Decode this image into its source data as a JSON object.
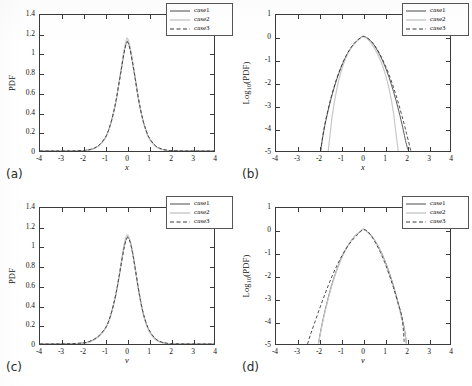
{
  "figure": {
    "panel_tags": [
      "(a)",
      "(b)",
      "(c)",
      "(d)"
    ],
    "legend_entries": [
      "case1",
      "case2",
      "case3"
    ],
    "colors": {
      "case1": "#4a4a4a",
      "case2": "#c8c8c8",
      "case3": "#3a3a3a",
      "axis": "#3a3a3a",
      "background": "#ffffff"
    }
  },
  "chart_data": [
    {
      "type": "line",
      "panel": "(a)",
      "title": "",
      "xlabel": "x",
      "ylabel": "PDF",
      "xlim": [
        -4,
        4
      ],
      "ylim": [
        0,
        1.4
      ],
      "xticks": [
        -4,
        -3,
        -2,
        -1,
        0,
        1,
        2,
        3,
        4
      ],
      "xticklabels": [
        "-4",
        "-3",
        "-2",
        "-1",
        "0",
        "1",
        "2",
        "3",
        "4"
      ],
      "yticks": [
        0,
        0.2,
        0.4,
        0.6,
        0.8,
        1,
        1.2,
        1.4
      ],
      "yticklabels": [
        "0",
        "0.2",
        "0.4",
        "0.6",
        "0.8",
        "1",
        "1.2",
        "1.4"
      ],
      "grid": false,
      "legend_position": "upper right",
      "series": [
        {
          "name": "case1",
          "style": "solid",
          "x": [
            -4,
            -3.5,
            -3,
            -2.5,
            -2,
            -1.75,
            -1.5,
            -1.25,
            -1,
            -0.875,
            -0.75,
            -0.625,
            -0.5,
            -0.375,
            -0.25,
            -0.125,
            0,
            0.125,
            0.25,
            0.375,
            0.5,
            0.625,
            0.75,
            0.875,
            1,
            1.25,
            1.5,
            1.75,
            2,
            2.5,
            3,
            3.5,
            4
          ],
          "values": [
            0.0,
            0.0,
            0.0,
            0.001,
            0.004,
            0.011,
            0.028,
            0.065,
            0.135,
            0.196,
            0.28,
            0.39,
            0.52,
            0.69,
            0.86,
            1.03,
            1.13,
            1.07,
            0.92,
            0.75,
            0.57,
            0.42,
            0.3,
            0.21,
            0.14,
            0.062,
            0.026,
            0.01,
            0.004,
            0.001,
            0.0,
            0.0,
            0.0
          ]
        },
        {
          "name": "case2",
          "style": "dotted-light",
          "x": [
            -4,
            -3.5,
            -3,
            -2.5,
            -2,
            -1.75,
            -1.5,
            -1.25,
            -1,
            -0.875,
            -0.75,
            -0.625,
            -0.5,
            -0.375,
            -0.25,
            -0.125,
            0,
            0.125,
            0.25,
            0.375,
            0.5,
            0.625,
            0.75,
            0.875,
            1,
            1.25,
            1.5,
            1.75,
            2,
            2.5,
            3,
            3.5,
            4
          ],
          "values": [
            0.0,
            0.0,
            0.0,
            0.0005,
            0.003,
            0.009,
            0.025,
            0.06,
            0.13,
            0.192,
            0.277,
            0.388,
            0.52,
            0.69,
            0.87,
            1.05,
            1.16,
            1.09,
            0.93,
            0.755,
            0.575,
            0.42,
            0.295,
            0.205,
            0.135,
            0.058,
            0.023,
            0.008,
            0.003,
            0.0005,
            0.0,
            0.0,
            0.0
          ]
        },
        {
          "name": "case3",
          "style": "dashed",
          "x": [
            -4,
            -3.5,
            -3,
            -2.5,
            -2,
            -1.75,
            -1.5,
            -1.25,
            -1,
            -0.875,
            -0.75,
            -0.625,
            -0.5,
            -0.375,
            -0.25,
            -0.125,
            0,
            0.125,
            0.25,
            0.375,
            0.5,
            0.625,
            0.75,
            0.875,
            1,
            1.25,
            1.5,
            1.75,
            2,
            2.5,
            3,
            3.5,
            4
          ],
          "values": [
            0.0,
            0.0,
            0.0,
            0.001,
            0.005,
            0.013,
            0.031,
            0.068,
            0.138,
            0.199,
            0.283,
            0.392,
            0.522,
            0.688,
            0.855,
            1.02,
            1.12,
            1.06,
            0.915,
            0.748,
            0.573,
            0.425,
            0.305,
            0.215,
            0.145,
            0.066,
            0.029,
            0.012,
            0.005,
            0.001,
            0.0,
            0.0,
            0.0
          ]
        }
      ]
    },
    {
      "type": "line",
      "panel": "(b)",
      "title": "",
      "xlabel": "x",
      "ylabel": "Log10(PDF)",
      "xlim": [
        -4,
        4
      ],
      "ylim": [
        -5,
        1
      ],
      "xticks": [
        -4,
        -3,
        -2,
        -1,
        0,
        1,
        2,
        3,
        4
      ],
      "xticklabels": [
        "-4",
        "-3",
        "-2",
        "-1",
        "0",
        "1",
        "2",
        "3",
        "4"
      ],
      "yticks": [
        -5,
        -4,
        -3,
        -2,
        -1,
        0,
        1
      ],
      "yticklabels": [
        "-5",
        "-4",
        "-3",
        "-2",
        "-1",
        "0",
        "1"
      ],
      "grid": false,
      "legend_position": "upper right",
      "series": [
        {
          "name": "case1",
          "style": "solid",
          "x": [
            -1.95,
            -1.8,
            -1.6,
            -1.4,
            -1.2,
            -1.0,
            -0.8,
            -0.6,
            -0.4,
            -0.2,
            0,
            0.2,
            0.4,
            0.6,
            0.8,
            1.0,
            1.2,
            1.4,
            1.6,
            1.8,
            2.0,
            2.1
          ],
          "values": [
            -5.0,
            -4.1,
            -3.2,
            -2.45,
            -1.82,
            -1.3,
            -0.86,
            -0.52,
            -0.25,
            -0.07,
            0.06,
            -0.02,
            -0.19,
            -0.46,
            -0.81,
            -1.24,
            -1.76,
            -2.37,
            -3.06,
            -3.85,
            -4.72,
            -5.0
          ]
        },
        {
          "name": "case2",
          "style": "dotted-light",
          "x": [
            -1.6,
            -1.5,
            -1.4,
            -1.25,
            -1.1,
            -0.9,
            -0.7,
            -0.5,
            -0.3,
            -0.1,
            0,
            0.1,
            0.3,
            0.5,
            0.7,
            0.9,
            1.1,
            1.25,
            1.4,
            1.5,
            1.62
          ],
          "values": [
            -5.0,
            -4.15,
            -3.35,
            -2.5,
            -1.82,
            -1.18,
            -0.72,
            -0.4,
            -0.17,
            -0.02,
            0.07,
            0.02,
            -0.15,
            -0.42,
            -0.78,
            -1.24,
            -1.86,
            -2.48,
            -3.3,
            -4.1,
            -5.0
          ]
        },
        {
          "name": "case3",
          "style": "dashed",
          "x": [
            -1.95,
            -1.8,
            -1.6,
            -1.4,
            -1.2,
            -1.0,
            -0.8,
            -0.6,
            -0.4,
            -0.2,
            0,
            0.2,
            0.4,
            0.6,
            0.8,
            1.0,
            1.2,
            1.4,
            1.6,
            1.8,
            2.0,
            2.2
          ],
          "values": [
            -5.0,
            -4.05,
            -3.15,
            -2.4,
            -1.78,
            -1.27,
            -0.84,
            -0.51,
            -0.25,
            -0.07,
            0.05,
            -0.02,
            -0.18,
            -0.44,
            -0.77,
            -1.17,
            -1.64,
            -2.19,
            -2.8,
            -3.48,
            -4.22,
            -5.0
          ]
        }
      ]
    },
    {
      "type": "line",
      "panel": "(c)",
      "title": "",
      "xlabel": "v",
      "ylabel": "PDF",
      "xlim": [
        -4,
        4
      ],
      "ylim": [
        0,
        1.4
      ],
      "xticks": [
        -4,
        -3,
        -2,
        -1,
        0,
        1,
        2,
        3,
        4
      ],
      "xticklabels": [
        "-4",
        "-3",
        "-2",
        "-1",
        "0",
        "1",
        "2",
        "3",
        "4"
      ],
      "yticks": [
        0,
        0.2,
        0.4,
        0.6,
        0.8,
        1,
        1.2,
        1.4
      ],
      "yticklabels": [
        "0",
        "0.2",
        "0.4",
        "0.6",
        "0.8",
        "1",
        "1.2",
        "1.4"
      ],
      "grid": false,
      "legend_position": "upper right",
      "series": [
        {
          "name": "case1",
          "style": "solid",
          "x": [
            -4,
            -3.5,
            -3,
            -2.5,
            -2,
            -1.75,
            -1.5,
            -1.25,
            -1,
            -0.875,
            -0.75,
            -0.625,
            -0.5,
            -0.375,
            -0.25,
            -0.125,
            0,
            0.125,
            0.25,
            0.375,
            0.5,
            0.625,
            0.75,
            0.875,
            1,
            1.25,
            1.5,
            1.75,
            2,
            2.5,
            3,
            3.5,
            4
          ],
          "values": [
            0.0,
            0.0,
            0.001,
            0.003,
            0.01,
            0.022,
            0.048,
            0.09,
            0.16,
            0.215,
            0.295,
            0.4,
            0.525,
            0.68,
            0.85,
            1.01,
            1.1,
            1.07,
            0.95,
            0.78,
            0.6,
            0.44,
            0.31,
            0.215,
            0.145,
            0.062,
            0.024,
            0.009,
            0.003,
            0.0005,
            0.0,
            0.0,
            0.0
          ]
        },
        {
          "name": "case2",
          "style": "dotted-light",
          "x": [
            -4,
            -3.5,
            -3,
            -2.5,
            -2,
            -1.75,
            -1.5,
            -1.25,
            -1,
            -0.875,
            -0.75,
            -0.625,
            -0.5,
            -0.375,
            -0.25,
            -0.125,
            0,
            0.125,
            0.25,
            0.375,
            0.5,
            0.625,
            0.75,
            0.875,
            1,
            1.25,
            1.5,
            1.75,
            2,
            2.5,
            3,
            3.5,
            4
          ],
          "values": [
            0.0,
            0.0,
            0.0,
            0.002,
            0.008,
            0.019,
            0.044,
            0.086,
            0.156,
            0.212,
            0.292,
            0.398,
            0.525,
            0.685,
            0.858,
            1.03,
            1.12,
            1.08,
            0.955,
            0.782,
            0.6,
            0.438,
            0.305,
            0.208,
            0.138,
            0.056,
            0.021,
            0.007,
            0.002,
            0.0003,
            0.0,
            0.0,
            0.0
          ]
        },
        {
          "name": "case3",
          "style": "dashed",
          "x": [
            -4,
            -3.5,
            -3,
            -2.5,
            -2,
            -1.75,
            -1.5,
            -1.25,
            -1,
            -0.875,
            -0.75,
            -0.625,
            -0.5,
            -0.375,
            -0.25,
            -0.125,
            0,
            0.125,
            0.25,
            0.375,
            0.5,
            0.625,
            0.75,
            0.875,
            1,
            1.25,
            1.5,
            1.75,
            2,
            2.5,
            3,
            3.5,
            4
          ],
          "values": [
            0.0,
            0.0,
            0.001,
            0.004,
            0.012,
            0.025,
            0.051,
            0.093,
            0.162,
            0.218,
            0.297,
            0.402,
            0.526,
            0.678,
            0.845,
            1.0,
            1.09,
            1.06,
            0.945,
            0.78,
            0.602,
            0.445,
            0.315,
            0.222,
            0.152,
            0.068,
            0.028,
            0.011,
            0.004,
            0.0008,
            0.0,
            0.0,
            0.0
          ]
        }
      ]
    },
    {
      "type": "line",
      "panel": "(d)",
      "title": "",
      "xlabel": "v",
      "ylabel": "Log10(PDF)",
      "xlim": [
        -4,
        4
      ],
      "ylim": [
        -5,
        1
      ],
      "xticks": [
        -4,
        -3,
        -2,
        -1,
        0,
        1,
        2,
        3,
        4
      ],
      "xticklabels": [
        "-4",
        "-3",
        "-2",
        "-1",
        "0",
        "1",
        "2",
        "3",
        "4"
      ],
      "yticks": [
        -5,
        -4,
        -3,
        -2,
        -1,
        0,
        1
      ],
      "yticklabels": [
        "-5",
        "-4",
        "-3",
        "-2",
        "-1",
        "0",
        "1"
      ],
      "grid": false,
      "legend_position": "upper right",
      "series": [
        {
          "name": "case1",
          "style": "solid",
          "x": [
            -2.05,
            -1.9,
            -1.7,
            -1.5,
            -1.3,
            -1.1,
            -0.9,
            -0.7,
            -0.5,
            -0.3,
            -0.1,
            0,
            0.1,
            0.3,
            0.5,
            0.7,
            0.9,
            1.1,
            1.3,
            1.5,
            1.7,
            1.9,
            2.0
          ],
          "values": [
            -5.0,
            -4.2,
            -3.35,
            -2.6,
            -1.98,
            -1.46,
            -1.02,
            -0.66,
            -0.38,
            -0.16,
            -0.02,
            0.06,
            0.02,
            -0.13,
            -0.37,
            -0.69,
            -1.08,
            -1.56,
            -2.12,
            -2.77,
            -3.5,
            -4.32,
            -5.0
          ]
        },
        {
          "name": "case2",
          "style": "dotted-light",
          "x": [
            -2.05,
            -1.9,
            -1.7,
            -1.5,
            -1.3,
            -1.1,
            -0.9,
            -0.7,
            -0.5,
            -0.3,
            -0.1,
            0,
            0.1,
            0.3,
            0.5,
            0.7,
            0.9,
            1.1,
            1.3,
            1.5,
            1.7,
            1.9,
            2.0
          ],
          "values": [
            -5.0,
            -4.25,
            -3.4,
            -2.65,
            -2.02,
            -1.48,
            -1.04,
            -0.67,
            -0.39,
            -0.16,
            -0.02,
            0.07,
            0.02,
            -0.14,
            -0.38,
            -0.7,
            -1.1,
            -1.59,
            -2.16,
            -2.82,
            -3.56,
            -4.4,
            -5.0
          ]
        },
        {
          "name": "case3",
          "style": "dashed",
          "x": [
            -2.55,
            -2.4,
            -2.2,
            -2.0,
            -1.8,
            -1.6,
            -1.4,
            -1.2,
            -1.0,
            -0.8,
            -0.6,
            -0.4,
            -0.2,
            0,
            0.2,
            0.4,
            0.6,
            0.8,
            1.0,
            1.2,
            1.4,
            1.6,
            1.8,
            1.9
          ],
          "values": [
            -5.0,
            -4.55,
            -4.0,
            -3.45,
            -2.93,
            -2.43,
            -1.96,
            -1.54,
            -1.16,
            -0.83,
            -0.55,
            -0.32,
            -0.13,
            0.05,
            -0.02,
            -0.26,
            -0.58,
            -0.96,
            -1.41,
            -1.93,
            -2.51,
            -3.16,
            -3.87,
            -5.0
          ]
        }
      ]
    }
  ]
}
